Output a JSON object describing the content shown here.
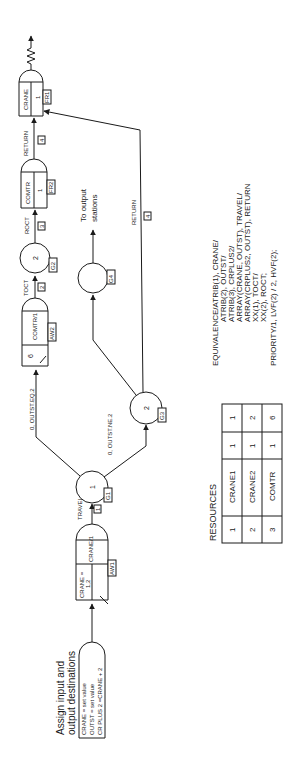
{
  "diagram": {
    "orientation": "rotated 90 degrees counter-clockwise",
    "assign_note": {
      "line1": "Assign input and",
      "line2": "output destinations"
    },
    "assign_node": {
      "line1": "CRANE = set value",
      "line2": "OUTST = set value",
      "line3": "CR PLUS 2 =CRANE + 2"
    },
    "await1": {
      "resource": "CRANE =",
      "resource2": "1,2",
      "label": "CRANE/1",
      "id": "AW1"
    },
    "activity1": {
      "label": "TRAVEL",
      "num": "1"
    },
    "goon1": {
      "num": "1",
      "id": "G1"
    },
    "branch1": {
      "condition": "0, OUTST.EQ.2"
    },
    "branch2": {
      "condition": "0, OUTST.NE.2"
    },
    "await2": {
      "capacity": "6",
      "label": "COMTR/1",
      "id": "AW2"
    },
    "activity2": {
      "label": "TOCT",
      "num": "2"
    },
    "goon2": {
      "num": "2",
      "id": "G2"
    },
    "activity3": {
      "label": "ROCT",
      "num": "3"
    },
    "free2": {
      "label": "COMTR",
      "num": "1",
      "id": "FR2"
    },
    "activity4": {
      "label": "RETURN",
      "num": "4"
    },
    "free1": {
      "label": "CRANE",
      "num": "1",
      "id": "FR1"
    },
    "goon3": {
      "num": "2",
      "id": "G3"
    },
    "goon4": {
      "id": "G4"
    },
    "to_output": {
      "line1": "To output",
      "line2": "stations"
    },
    "return_branch": {
      "label": "RETURN",
      "num": "4"
    }
  },
  "resources": {
    "title": "RESOURCES",
    "rows": [
      {
        "num": "1",
        "name": "CRANE1",
        "cap": "1",
        "file": "1"
      },
      {
        "num": "2",
        "name": "CRANE2",
        "cap": "1",
        "file": "2"
      },
      {
        "num": "3",
        "name": "COMTR",
        "cap": "1",
        "file": "6"
      }
    ]
  },
  "equivalence": {
    "lines": [
      "EQUIVALENCE/ATRIB(1), CRANE/",
      "ATRIB(2), OUTST/",
      "ATRIB(3), CRPLUS2/",
      "ARRAY(CRANE, OUTST), TRAVEL/",
      "ARRAY(CRPLUS2, OUTST), RETURN",
      "XX(1), TOCT/",
      "XX(2), ROCT;",
      "PRIORITY/1, LVF(2) / 2, HVF(2);"
    ]
  }
}
